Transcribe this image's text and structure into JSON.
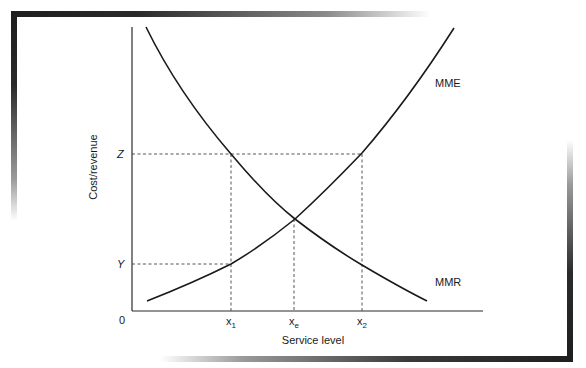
{
  "diagram": {
    "type": "economic-curve-diagram",
    "y_axis_label": "Cost/revenue",
    "x_axis_label": "Service level",
    "origin_label": "0",
    "y_ticks": [
      {
        "label": "Z",
        "name": "z-level"
      },
      {
        "label": "Y",
        "name": "y-level"
      }
    ],
    "x_ticks": [
      {
        "label": "x",
        "sub": "1",
        "name": "x1"
      },
      {
        "label": "x",
        "sub": "e",
        "name": "xe"
      },
      {
        "label": "x",
        "sub": "2",
        "name": "x2"
      }
    ],
    "curves": [
      {
        "label": "MME",
        "description": "increasing curve",
        "color": "#1a1a1a"
      },
      {
        "label": "MMR",
        "description": "decreasing curve",
        "color": "#1a1a1a"
      }
    ],
    "annotations": {
      "intersection": "MME = MMR at x_e",
      "guides": "dashed lines from Z to x1 (MMR) and x2 (MME); from Y to x1 (MME); vertical at xe"
    }
  }
}
